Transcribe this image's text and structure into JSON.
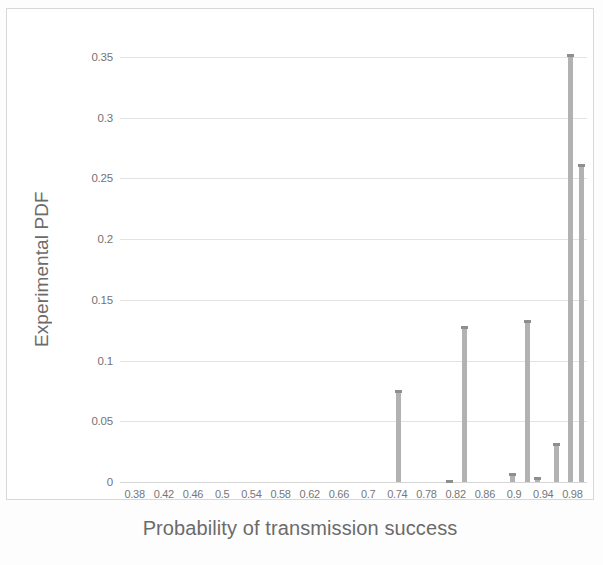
{
  "chart_data": {
    "type": "bar",
    "title": "",
    "xlabel": "Probability of transmission success",
    "ylabel": "Experimental PDF",
    "xlim": [
      0.36,
      1.0
    ],
    "ylim": [
      0,
      0.35
    ],
    "grid": true,
    "legend": "none",
    "xticks": [
      "0.38",
      "0.42",
      "0.46",
      "0.5",
      "0.54",
      "0.58",
      "0.62",
      "0.66",
      "0.7",
      "0.74",
      "0.78",
      "0.82",
      "0.86",
      "0.9",
      "0.94",
      "0.98"
    ],
    "xtick_values": [
      0.38,
      0.42,
      0.46,
      0.5,
      0.54,
      0.58,
      0.62,
      0.66,
      0.7,
      0.74,
      0.78,
      0.82,
      0.86,
      0.9,
      0.94,
      0.98
    ],
    "yticks": [
      "0",
      "0.05",
      "0.1",
      "0.15",
      "0.2",
      "0.25",
      "0.3",
      "0.35"
    ],
    "ytick_values": [
      0,
      0.05,
      0.1,
      0.15,
      0.2,
      0.25,
      0.3,
      0.35
    ],
    "bar_color": "#b2b2b2",
    "x": [
      0.742,
      0.812,
      0.832,
      0.898,
      0.918,
      0.932,
      0.958,
      0.978
    ],
    "values": [
      0.0755,
      0.0018,
      0.1288,
      0.0078,
      0.1332,
      0.0042,
      0.0318,
      0.3522
    ],
    "series": [
      {
        "name": "Experimental PDF",
        "x": [
          0.742,
          0.812,
          0.832,
          0.898,
          0.918,
          0.932,
          0.958,
          0.978,
          0.992
        ],
        "values": [
          0.0755,
          0.0018,
          0.1288,
          0.0078,
          0.1332,
          0.0042,
          0.0318,
          0.3522,
          0.2615
        ]
      }
    ]
  },
  "axes": {
    "y_title": "Experimental PDF",
    "x_title": "Probability of transmission success"
  }
}
